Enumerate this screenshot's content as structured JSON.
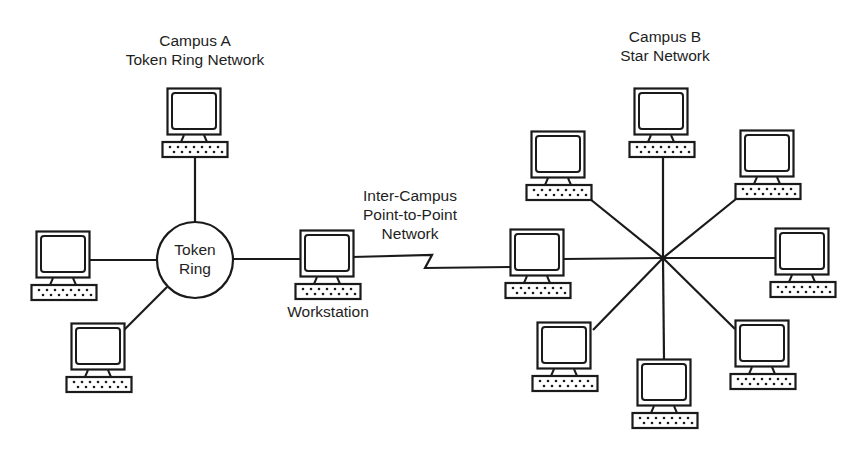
{
  "diagram": {
    "campus_a": {
      "title_line1": "Campus A",
      "title_line2": "Token Ring Network",
      "ring_label_line1": "Token",
      "ring_label_line2": "Ring",
      "nodes": [
        {
          "id": "a-top",
          "x": 162,
          "y": 88
        },
        {
          "id": "a-left",
          "x": 31,
          "y": 231
        },
        {
          "id": "a-bottom-left",
          "x": 66,
          "y": 323
        }
      ]
    },
    "workstation": {
      "label": "Workstation",
      "x": 295,
      "y": 230
    },
    "link": {
      "label_line1": "Inter-Campus",
      "label_line2": "Point-to-Point",
      "label_line3": "Network"
    },
    "campus_b": {
      "title_line1": "Campus B",
      "title_line2": "Star Network",
      "hub": {
        "x": 663,
        "y": 258
      },
      "nodes": [
        {
          "id": "b-left",
          "x": 505,
          "y": 229
        },
        {
          "id": "b-top",
          "x": 629,
          "y": 88
        },
        {
          "id": "b-upper-left",
          "x": 526,
          "y": 131
        },
        {
          "id": "b-upper-right",
          "x": 735,
          "y": 130
        },
        {
          "id": "b-right",
          "x": 770,
          "y": 228
        },
        {
          "id": "b-lower-left",
          "x": 532,
          "y": 322
        },
        {
          "id": "b-bottom",
          "x": 632,
          "y": 359
        },
        {
          "id": "b-lower-right",
          "x": 730,
          "y": 320
        }
      ]
    },
    "colors": {
      "line": "#1a1a1a",
      "background": "#ffffff"
    }
  }
}
